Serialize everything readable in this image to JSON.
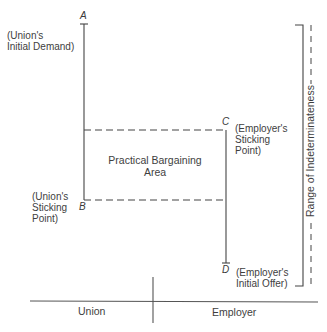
{
  "diagram": {
    "points": {
      "A": {
        "letter": "A",
        "label_line1": "(Union's",
        "label_line2": "Initial Demand)"
      },
      "B": {
        "letter": "B",
        "label_line1": "(Union's",
        "label_line2": "Sticking",
        "label_line3": "Point)"
      },
      "C": {
        "letter": "C",
        "label_line1": "(Employer's",
        "label_line2": "Sticking",
        "label_line3": "Point)"
      },
      "D": {
        "letter": "D",
        "label_line1": "(Employer's",
        "label_line2": "Initial Offer)"
      }
    },
    "area_label_line1": "Practical Bargaining",
    "area_label_line2": "Area",
    "range_label": "Range of Indeterminateness",
    "axis": {
      "left": "Union",
      "right": "Employer"
    }
  }
}
